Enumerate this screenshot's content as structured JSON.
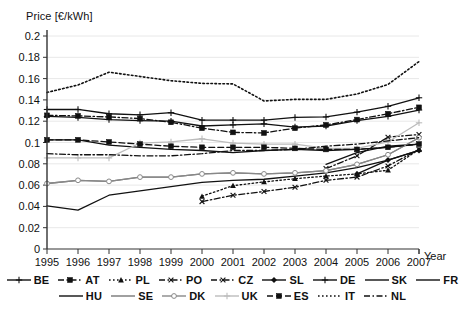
{
  "chart_data": {
    "type": "line",
    "title": "",
    "ylabel": "Price [€/kWh]",
    "xlabel": "Year",
    "ylim": [
      0,
      0.2
    ],
    "ytick_labels": [
      "0",
      "0.02",
      "0.04",
      "0.06",
      "0.08",
      "0.1",
      "0.12",
      "0.14",
      "0.16",
      "0.18",
      "0.2"
    ],
    "ytick_values": [
      0,
      0.02,
      0.04,
      0.06,
      0.08,
      0.1,
      0.12,
      0.14,
      0.16,
      0.18,
      0.2
    ],
    "grid": true,
    "legend_position": "bottom",
    "x": [
      1995,
      1996,
      1997,
      1998,
      1999,
      2000,
      2001,
      2002,
      2003,
      2004,
      2005,
      2006,
      2007
    ],
    "categories": [
      "1995",
      "1996",
      "1997",
      "1998",
      "1999",
      "2000",
      "2001",
      "2002",
      "2003",
      "2004",
      "2005",
      "2006",
      "2007"
    ],
    "series": [
      {
        "name": "BE",
        "style": "solid",
        "marker": "plus",
        "color": "#111111",
        "values": [
          0.131,
          0.131,
          0.127,
          0.126,
          0.128,
          0.121,
          0.121,
          0.121,
          0.1235,
          0.124,
          0.1285,
          0.134,
          0.142
        ]
      },
      {
        "name": "AT",
        "style": "dashdot",
        "marker": "square",
        "color": "#111111",
        "values": [
          0.1255,
          0.125,
          0.124,
          0.1225,
          0.119,
          0.1135,
          0.1095,
          0.109,
          0.1135,
          0.1165,
          0.1215,
          0.127,
          0.133
        ]
      },
      {
        "name": "PL",
        "style": "dotted",
        "marker": "triangle",
        "color": "#111111",
        "values": [
          null,
          null,
          null,
          null,
          null,
          0.0495,
          0.0595,
          0.063,
          0.066,
          0.0685,
          0.0705,
          0.074,
          0.0935
        ]
      },
      {
        "name": "PO",
        "style": "dashdot",
        "marker": "x",
        "color": "#111111",
        "values": [
          null,
          null,
          null,
          null,
          null,
          0.0445,
          0.0505,
          0.054,
          0.058,
          0.0645,
          0.0675,
          0.078,
          0.0935
        ]
      },
      {
        "name": "CZ",
        "style": "dashdot",
        "marker": "x",
        "color": "#111111",
        "values": [
          null,
          null,
          null,
          null,
          null,
          null,
          null,
          null,
          null,
          0.0755,
          0.0875,
          0.105,
          0.1075
        ]
      },
      {
        "name": "SL",
        "style": "solid",
        "marker": "diamond",
        "color": "#111111",
        "values": [
          null,
          null,
          null,
          null,
          null,
          null,
          null,
          null,
          null,
          null,
          0.0705,
          0.0835,
          0.0925
        ]
      },
      {
        "name": "DE",
        "style": "solid",
        "marker": "plus",
        "color": "#111111",
        "values": [
          0.1245,
          0.1235,
          0.1215,
          0.1205,
          0.12,
          0.1155,
          0.1165,
          0.1175,
          0.1145,
          0.1155,
          0.1205,
          0.1245,
          0.1305
        ]
      },
      {
        "name": "SK",
        "style": "solid",
        "marker": "none",
        "color": "#111111",
        "values": [
          null,
          null,
          null,
          null,
          null,
          null,
          null,
          null,
          null,
          0.0795,
          0.0905,
          0.0965,
          0.0985
        ]
      },
      {
        "name": "FR",
        "style": "solid",
        "marker": "none",
        "color": "#111111",
        "values": [
          0.1025,
          0.1025,
          0.0975,
          0.0955,
          0.0935,
          0.0925,
          0.0905,
          0.0925,
          0.0935,
          0.0925,
          0.0935,
          0.0955,
          0.0985
        ]
      },
      {
        "name": "HU",
        "style": "solid",
        "marker": "none",
        "color": "#111111",
        "values": [
          0.0405,
          0.0365,
          0.0505,
          0.0545,
          0.0585,
          0.0625,
          0.0645,
          0.0655,
          0.0685,
          0.0715,
          0.0765,
          0.0835,
          0.0925
        ]
      },
      {
        "name": "SE",
        "style": "solid",
        "marker": "none",
        "color": "#777777",
        "values": [
          0.0615,
          0.0645,
          0.0635,
          0.0675,
          0.0675,
          0.0705,
          0.0715,
          0.0705,
          0.0715,
          0.0735,
          0.0795,
          0.0885,
          0.1045
        ]
      },
      {
        "name": "DK",
        "style": "solid",
        "marker": "circle-open",
        "color": "#888888",
        "values": [
          0.0615,
          0.0645,
          0.0635,
          0.0675,
          0.0675,
          0.0705,
          0.0715,
          0.0705,
          0.0715,
          0.0735,
          0.0795,
          0.0885,
          0.1045
        ]
      },
      {
        "name": "UK",
        "style": "solid",
        "marker": "plus",
        "color": "#bcbcbc",
        "values": [
          0.0855,
          0.0855,
          0.0855,
          0.0995,
          0.1005,
          0.1035,
          0.0995,
          0.0985,
          0.0985,
          0.0945,
          0.0945,
          0.1005,
          0.1185
        ]
      },
      {
        "name": "ES",
        "style": "dashed",
        "marker": "square",
        "color": "#111111",
        "values": [
          0.1025,
          0.1025,
          0.1005,
          0.0985,
          0.0965,
          0.0955,
          0.0955,
          0.0955,
          0.0945,
          0.0935,
          0.0935,
          0.0955,
          0.0985
        ]
      },
      {
        "name": "IT",
        "style": "dotted",
        "marker": "none",
        "color": "#111111",
        "values": [
          0.147,
          0.154,
          0.166,
          0.162,
          0.158,
          0.1555,
          0.155,
          0.139,
          0.1405,
          0.1405,
          0.1455,
          0.1545,
          0.176
        ]
      },
      {
        "name": "NL",
        "style": "dashdot",
        "marker": "none",
        "color": "#111111",
        "values": [
          0.0895,
          0.0885,
          0.0885,
          0.0875,
          0.0875,
          0.0895,
          0.0925,
          0.0925,
          0.0935,
          0.0965,
          0.0985,
          0.1015,
          0.1045
        ]
      }
    ]
  },
  "legend": {
    "rows": [
      [
        {
          "label": "BE",
          "style": "solid",
          "marker": "plus",
          "color": "#111111"
        },
        {
          "label": "AT",
          "style": "dashdot",
          "marker": "square",
          "color": "#111111"
        },
        {
          "label": "PL",
          "style": "dotted",
          "marker": "triangle",
          "color": "#111111"
        },
        {
          "label": "PO",
          "style": "dashdot",
          "marker": "x",
          "color": "#111111"
        },
        {
          "label": "CZ",
          "style": "dashdot",
          "marker": "x",
          "color": "#111111"
        },
        {
          "label": "SL",
          "style": "solid",
          "marker": "diamond",
          "color": "#111111"
        },
        {
          "label": "DE",
          "style": "solid",
          "marker": "plus",
          "color": "#111111"
        },
        {
          "label": "SK",
          "style": "solid",
          "marker": "none",
          "color": "#111111"
        },
        {
          "label": "FR",
          "style": "solid",
          "marker": "none",
          "color": "#111111"
        }
      ],
      [
        {
          "label": "HU",
          "style": "solid",
          "marker": "none",
          "color": "#111111"
        },
        {
          "label": "SE",
          "style": "solid",
          "marker": "none",
          "color": "#777777"
        },
        {
          "label": "DK",
          "style": "solid",
          "marker": "circle-open",
          "color": "#888888"
        },
        {
          "label": "UK",
          "style": "solid",
          "marker": "plus",
          "color": "#bcbcbc"
        },
        {
          "label": "ES",
          "style": "dashed",
          "marker": "square",
          "color": "#111111"
        },
        {
          "label": "IT",
          "style": "dotted",
          "marker": "none",
          "color": "#111111"
        },
        {
          "label": "NL",
          "style": "dashdot",
          "marker": "none",
          "color": "#111111"
        }
      ]
    ]
  },
  "axes": {
    "y_title": "Price [€/kWh]",
    "x_title": "Year"
  }
}
